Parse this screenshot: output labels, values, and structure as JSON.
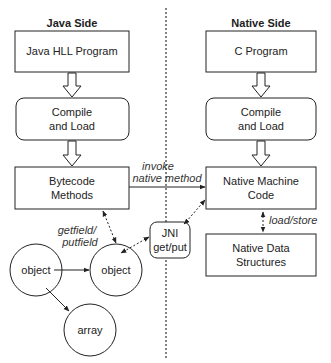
{
  "headers": {
    "java": "Java Side",
    "native": "Native Side"
  },
  "java": {
    "program": "Java HLL Program",
    "compile": [
      "Compile",
      "and Load"
    ],
    "bytecode": [
      "Bytecode",
      "Methods"
    ],
    "object_a": "object",
    "object_b": "object",
    "array": "array"
  },
  "native": {
    "program": "C Program",
    "compile": [
      "Compile",
      "and Load"
    ],
    "machine": [
      "Native Machine",
      "Code"
    ],
    "data": [
      "Native Data",
      "Structures"
    ]
  },
  "jni": [
    "JNI",
    "get/put"
  ],
  "edges": {
    "invoke": [
      "invoke",
      "native method"
    ],
    "getfield": [
      "getfield/",
      "putfield"
    ],
    "loadstore": "load/store"
  }
}
